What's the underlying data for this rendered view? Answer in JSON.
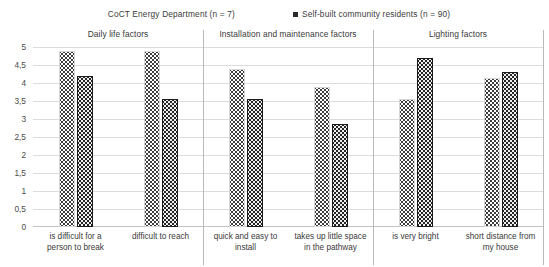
{
  "chart_data": {
    "type": "bar",
    "title": "",
    "xlabel": "",
    "ylabel": "",
    "ylim": [
      0,
      5
    ],
    "ytick_step": 0.5,
    "grid": true,
    "decimal_separator": ",",
    "legend_position": "top-center",
    "yticks": [
      "5",
      "4,5",
      "4",
      "3,5",
      "3",
      "2,5",
      "2",
      "1,5",
      "1",
      "0,5",
      "0"
    ],
    "ytick_values": [
      5,
      4.5,
      4,
      3.5,
      3,
      2.5,
      2,
      1.5,
      1,
      0.5,
      0
    ],
    "series": [
      {
        "name": "CoCT Energy Department (n = 7)",
        "key": "light",
        "swatch": "light-dotted-swatch",
        "values": [
          4.9,
          4.9,
          4.4,
          3.9,
          3.55,
          4.15
        ]
      },
      {
        "name": "Self-built community residents (n = 90)",
        "key": "dark",
        "swatch": "dark-dotted-swatch",
        "values": [
          4.2,
          3.55,
          3.55,
          2.85,
          4.7,
          4.3
        ]
      }
    ],
    "categories": [
      "is difficult for a person to break",
      "difficult to reach",
      "quick and easy to install",
      "takes up little space in the pathway",
      "is very bright",
      "short distance from my house"
    ],
    "panels": [
      {
        "title": "Daily life factors",
        "categories": [
          0,
          1
        ]
      },
      {
        "title": "Installation and maintenance factors",
        "categories": [
          2,
          3
        ]
      },
      {
        "title": "Lighting factors",
        "categories": [
          4,
          5
        ]
      }
    ],
    "colors": {
      "light_series": "#ffffff",
      "dark_series": "#242424",
      "gridline": "#dcdcdc",
      "separator": "#b9b9b9",
      "text": "#3a3a3a"
    }
  }
}
